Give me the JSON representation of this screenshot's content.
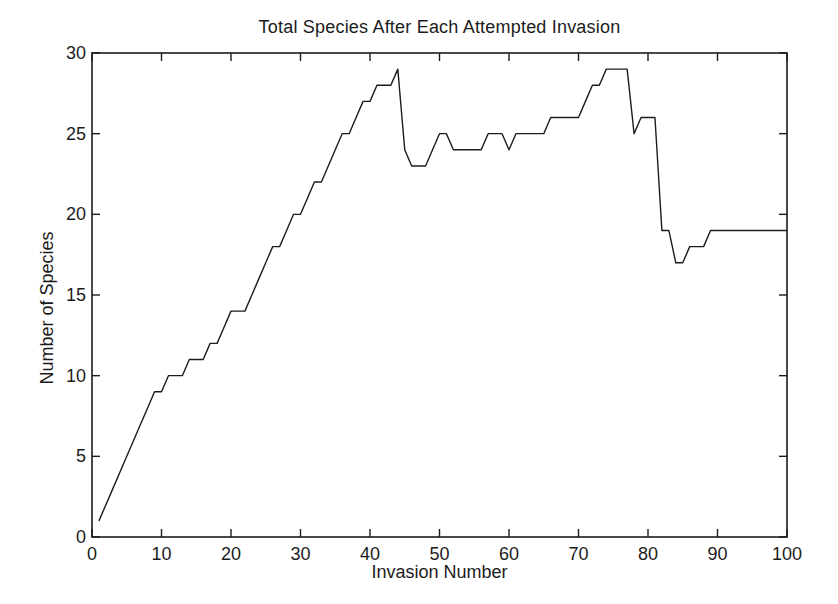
{
  "figure": {
    "background_color": "#ffffff",
    "axis_color": "#1c1c1c",
    "text_color": "#1c1c1c"
  },
  "chart_data": {
    "type": "line",
    "title": "Total Species After Each Attempted Invasion",
    "xlabel": "Invasion Number",
    "ylabel": "Number of Species",
    "xlim": [
      0,
      100
    ],
    "ylim": [
      0,
      30
    ],
    "xticks": [
      0,
      10,
      20,
      30,
      40,
      50,
      60,
      70,
      80,
      90,
      100
    ],
    "yticks": [
      0,
      5,
      10,
      15,
      20,
      25,
      30
    ],
    "grid": false,
    "legend": null,
    "line_color": "#1c1c1c",
    "x": [
      1,
      2,
      3,
      4,
      5,
      6,
      7,
      8,
      9,
      10,
      11,
      12,
      13,
      14,
      15,
      16,
      17,
      18,
      19,
      20,
      21,
      22,
      23,
      24,
      25,
      26,
      27,
      28,
      29,
      30,
      31,
      32,
      33,
      34,
      35,
      36,
      37,
      38,
      39,
      40,
      41,
      42,
      43,
      44,
      45,
      46,
      47,
      48,
      49,
      50,
      51,
      52,
      53,
      54,
      55,
      56,
      57,
      58,
      59,
      60,
      61,
      62,
      63,
      64,
      65,
      66,
      67,
      68,
      69,
      70,
      71,
      72,
      73,
      74,
      75,
      76,
      77,
      78,
      79,
      80,
      81,
      82,
      83,
      84,
      85,
      86,
      87,
      88,
      89,
      90,
      91,
      92,
      93,
      94,
      95,
      96,
      97,
      98,
      99,
      100
    ],
    "values": [
      1,
      2,
      3,
      4,
      5,
      6,
      7,
      8,
      9,
      9,
      10,
      10,
      10,
      11,
      11,
      11,
      12,
      12,
      13,
      14,
      14,
      14,
      15,
      16,
      17,
      18,
      18,
      19,
      20,
      20,
      21,
      22,
      22,
      23,
      24,
      25,
      25,
      26,
      27,
      27,
      28,
      28,
      28,
      29,
      24,
      23,
      23,
      23,
      24,
      25,
      25,
      24,
      24,
      24,
      24,
      24,
      25,
      25,
      25,
      24,
      25,
      25,
      25,
      25,
      25,
      26,
      26,
      26,
      26,
      26,
      27,
      28,
      28,
      29,
      29,
      29,
      29,
      25,
      26,
      26,
      26,
      19,
      19,
      17,
      17,
      18,
      18,
      18,
      19,
      19,
      19,
      19,
      19,
      19,
      19,
      19,
      19,
      19,
      19,
      19
    ]
  }
}
